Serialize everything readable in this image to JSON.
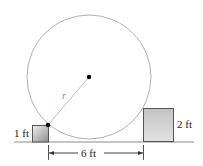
{
  "diagram": {
    "labels": {
      "radius": "r",
      "left_box_height": "1 ft",
      "right_box_height": "2 ft",
      "gap_distance": "6 ft"
    },
    "colors": {
      "circle_stroke": "#b0b0b0",
      "radius_line": "#b8b8b8",
      "ground_line": "#888888",
      "box_stroke": "#555555",
      "box_fill_light": "#e6e6e6",
      "box_fill_dark": "#9a9a9a",
      "point": "#000000"
    }
  }
}
